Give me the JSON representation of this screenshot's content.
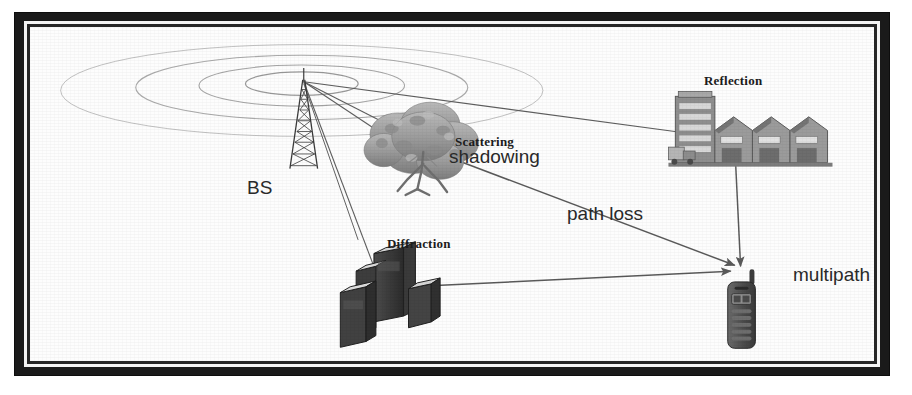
{
  "figure": {
    "kind": "radio-propagation-diagram",
    "background_color": "#fdfdfd",
    "frame_color": "#1a1a1a",
    "line_color": "#555555"
  },
  "labels": {
    "bs": "BS",
    "scattering": "Scattering",
    "shadowing": "shadowing",
    "reflection": "Reflection",
    "diffraction": "Diffraction",
    "path_loss": "path loss",
    "multipath": "multipath"
  },
  "objects": {
    "base_station": "lattice-radio-tower",
    "wave_rings": "concentric-ellipse-wavefronts",
    "tree": "scattering-tree",
    "factory": "reflection-factory-buildings",
    "city_block": "diffraction-building-cluster",
    "handset": "mobile-phone-receiver"
  },
  "propagation_paths": [
    {
      "name": "bs-to-reflection",
      "from": "base_station",
      "to": "factory",
      "arrow": false
    },
    {
      "name": "bs-to-scattering",
      "from": "base_station",
      "to": "tree",
      "arrow": false
    },
    {
      "name": "bs-to-diffraction",
      "from": "base_station",
      "to": "city_block",
      "arrow": false
    },
    {
      "name": "scattering-to-handset",
      "from": "tree",
      "to": "handset",
      "arrow": true,
      "annotation": "path loss"
    },
    {
      "name": "diffraction-to-handset",
      "from": "city_block",
      "to": "handset",
      "arrow": true
    },
    {
      "name": "reflection-to-handset",
      "from": "factory",
      "to": "handset",
      "arrow": true
    }
  ],
  "wave_rings_count": 4
}
